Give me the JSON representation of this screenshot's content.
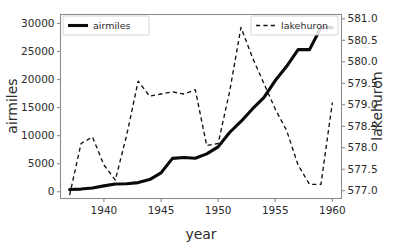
{
  "chart_data": {
    "type": "line",
    "title": "",
    "xlabel": "year",
    "ylabel": "airmiles",
    "y2label": "lakehuron",
    "grid": false,
    "xlim": [
      1936.2,
      1960.8
    ],
    "ylim": [
      -1200,
      31600
    ],
    "y2lim": [
      576.82,
      581.1
    ],
    "xticks": [
      1940,
      1945,
      1950,
      1955,
      1960
    ],
    "xtick_labels": [
      "1940",
      "1945",
      "1950",
      "1955",
      "1960"
    ],
    "yticks": [
      0,
      5000,
      10000,
      15000,
      20000,
      25000,
      30000
    ],
    "ytick_labels": [
      "0",
      "5000",
      "10000",
      "15000",
      "20000",
      "25000",
      "30000"
    ],
    "y2ticks": [
      577.0,
      577.5,
      578.0,
      578.5,
      579.0,
      579.5,
      580.0,
      580.5,
      581.0
    ],
    "y2tick_labels": [
      "577.0",
      "577.5",
      "578.0",
      "578.5",
      "579.0",
      "579.5",
      "580.0",
      "580.5",
      "581.0"
    ],
    "legend_position": "upper-left and upper-right",
    "series": [
      {
        "name": "airmiles",
        "axis": "left",
        "style": "solid",
        "color": "#0a0a0a",
        "x": [
          1937,
          1938,
          1939,
          1940,
          1941,
          1942,
          1943,
          1944,
          1945,
          1946,
          1947,
          1948,
          1949,
          1950,
          1951,
          1952,
          1953,
          1954,
          1955,
          1956,
          1957,
          1958,
          1959,
          1960
        ],
        "values": [
          412,
          480,
          683,
          1052,
          1385,
          1418,
          1634,
          2178,
          3362,
          5948,
          6109,
          5981,
          6753,
          8003,
          10566,
          12528,
          14760,
          16769,
          19819,
          22362,
          25340,
          25343,
          29269,
          29269
        ]
      },
      {
        "name": "lakehuron",
        "axis": "right",
        "style": "dashed",
        "color": "#111111",
        "x": [
          1937,
          1938,
          1939,
          1940,
          1941,
          1942,
          1943,
          1944,
          1945,
          1946,
          1947,
          1948,
          1949,
          1950,
          1951,
          1952,
          1953,
          1954,
          1955,
          1956,
          1957,
          1958,
          1959,
          1960
        ],
        "values": [
          576.9,
          578.1,
          578.25,
          577.6,
          577.25,
          578.3,
          579.55,
          579.2,
          579.25,
          579.3,
          579.25,
          579.35,
          578.05,
          578.1,
          579.3,
          580.8,
          580.1,
          579.5,
          578.9,
          578.4,
          577.6,
          577.15,
          577.15,
          579.05
        ]
      }
    ],
    "legend": [
      {
        "label": "airmiles",
        "style": "solid"
      },
      {
        "label": "lakehuron",
        "style": "dashed"
      }
    ]
  }
}
